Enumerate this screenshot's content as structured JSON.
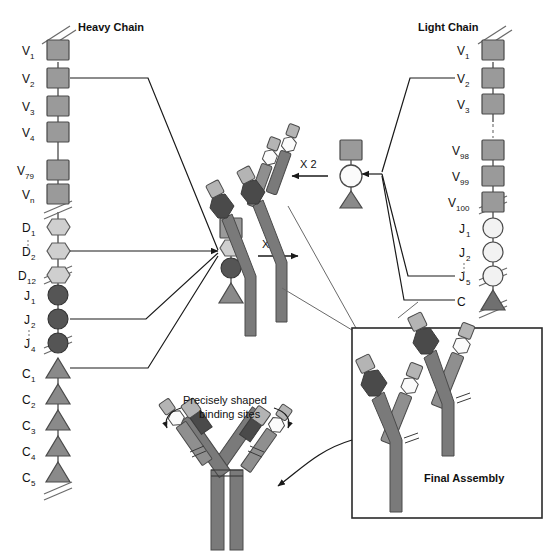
{
  "figure": {
    "title_left": "Heavy Chain",
    "title_right": "Light Chain",
    "annotation_binding_1": "Precisely shaped",
    "annotation_binding_2": "binding sites",
    "final_assembly_label": "Final Assembly",
    "multiplier_heavy": "X 2",
    "multiplier_light": "X 2"
  },
  "colors": {
    "v_segment": "#9a9a9a",
    "d_segment": "#cfcfcf",
    "j_segment_heavy": "#555555",
    "j_segment_light": "#f2f2f2",
    "c_segment": "#8a8a8a",
    "heavy_chain_body": "#7a7a7a",
    "light_chain_body": "#8f8f8f",
    "variable_dark": "#4a4a4a",
    "stroke": "#3a3a3a",
    "background": "#ffffff"
  },
  "heavy_chain": {
    "v_segments": [
      {
        "base": "V",
        "sub": "1"
      },
      {
        "base": "V",
        "sub": "2"
      },
      {
        "base": "V",
        "sub": "3"
      },
      {
        "base": "V",
        "sub": "4"
      },
      {
        "base": "V",
        "sub": "79"
      },
      {
        "base": "V",
        "sub": "n"
      }
    ],
    "d_segments": [
      {
        "base": "D",
        "sub": "1"
      },
      {
        "base": "D",
        "sub": "2"
      },
      {
        "base": "D",
        "sub": "12"
      }
    ],
    "j_segments": [
      {
        "base": "J",
        "sub": "1"
      },
      {
        "base": "J",
        "sub": "2"
      },
      {
        "base": "J",
        "sub": "4"
      }
    ],
    "c_segments": [
      {
        "base": "C",
        "sub": "1"
      },
      {
        "base": "C",
        "sub": "2"
      },
      {
        "base": "C",
        "sub": "3"
      },
      {
        "base": "C",
        "sub": "4"
      },
      {
        "base": "C",
        "sub": "5"
      }
    ]
  },
  "light_chain": {
    "v_segments": [
      {
        "base": "V",
        "sub": "1"
      },
      {
        "base": "V",
        "sub": "2"
      },
      {
        "base": "V",
        "sub": "3"
      },
      {
        "base": "V",
        "sub": "98"
      },
      {
        "base": "V",
        "sub": "99"
      },
      {
        "base": "V",
        "sub": "100"
      }
    ],
    "j_segments": [
      {
        "base": "J",
        "sub": "1"
      },
      {
        "base": "J",
        "sub": "2"
      },
      {
        "base": "J",
        "sub": "5"
      }
    ],
    "c_segments": [
      {
        "base": "C",
        "sub": ""
      }
    ]
  }
}
